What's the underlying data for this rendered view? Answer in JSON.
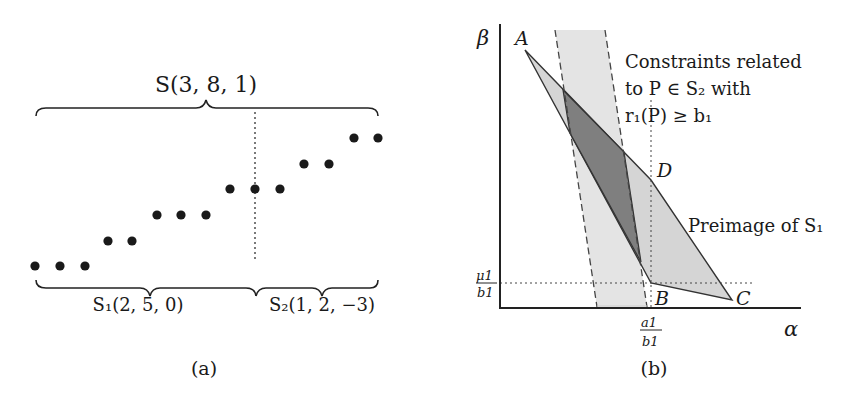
{
  "panel_a": {
    "caption": "(a)",
    "top_brace_label": "S(3, 8, 1)",
    "bottom_left_brace_label": "S₁(2, 5, 0)",
    "bottom_right_brace_label": "S₂(1, 2, −3)",
    "dots": [
      {
        "x": 35,
        "y": 266
      },
      {
        "x": 60,
        "y": 266
      },
      {
        "x": 85,
        "y": 266
      },
      {
        "x": 108,
        "y": 241
      },
      {
        "x": 132,
        "y": 241
      },
      {
        "x": 157,
        "y": 215
      },
      {
        "x": 181,
        "y": 215
      },
      {
        "x": 206,
        "y": 215
      },
      {
        "x": 230,
        "y": 189
      },
      {
        "x": 255,
        "y": 189
      },
      {
        "x": 280,
        "y": 189
      },
      {
        "x": 304,
        "y": 164
      },
      {
        "x": 329,
        "y": 164
      },
      {
        "x": 354,
        "y": 138
      },
      {
        "x": 378,
        "y": 138
      }
    ]
  },
  "panel_b": {
    "caption": "(b)",
    "y_axis_label": "β",
    "x_axis_label": "α",
    "point_labels": {
      "A": "A",
      "B": "B",
      "C": "C",
      "D": "D"
    },
    "y_tick": {
      "num": "μ1",
      "den": "b1"
    },
    "x_tick": {
      "num": "a1",
      "den": "b1"
    },
    "annotation_constraints": [
      "Constraints related",
      "to  P  ∈  S₂  with",
      "r₁(P) ≥ b₁"
    ],
    "annotation_preimage": "Preimage of S₁",
    "colors": {
      "light_region": "#d9d9d9",
      "dark_region": "#808080",
      "band": "#e6e6e6",
      "stroke": "#333333"
    }
  }
}
